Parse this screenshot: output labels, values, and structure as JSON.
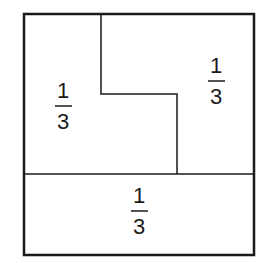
{
  "diagram": {
    "regions": [
      {
        "name": "left-region",
        "numerator": "1",
        "denominator": "3"
      },
      {
        "name": "right-region",
        "numerator": "1",
        "denominator": "3"
      },
      {
        "name": "bottom-region",
        "numerator": "1",
        "denominator": "3"
      }
    ],
    "colors": {
      "line": "#1a1a1a",
      "background": "#ffffff"
    }
  }
}
